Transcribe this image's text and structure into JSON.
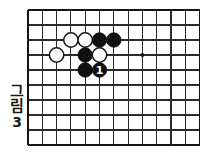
{
  "figure": {
    "caption_chars": [
      "그",
      "림"
    ],
    "caption_number": "3",
    "caption_full": "그림 3"
  },
  "board": {
    "columns": 13,
    "rows": 10,
    "origin_x": 28,
    "origin_y": 10,
    "spacing_x": 14.3,
    "spacing_y": 15,
    "line_color": "#2b2b2b",
    "edge_color": "#141414",
    "background_color": "#ffffff",
    "star_points": [
      {
        "col": 8,
        "row": 3,
        "label": "star-point"
      }
    ],
    "stones": [
      {
        "id": "w1",
        "color": "white",
        "col": 3,
        "row": 2,
        "label": ""
      },
      {
        "id": "w2",
        "color": "white",
        "col": 4,
        "row": 2,
        "label": ""
      },
      {
        "id": "b1",
        "color": "black",
        "col": 5,
        "row": 2,
        "label": ""
      },
      {
        "id": "b2",
        "color": "black",
        "col": 6,
        "row": 2,
        "label": ""
      },
      {
        "id": "w3",
        "color": "white",
        "col": 2,
        "row": 3,
        "label": ""
      },
      {
        "id": "b3",
        "color": "black",
        "col": 4,
        "row": 3,
        "label": ""
      },
      {
        "id": "w4",
        "color": "white",
        "col": 5,
        "row": 3,
        "label": ""
      },
      {
        "id": "b4",
        "color": "black",
        "col": 4,
        "row": 4,
        "label": ""
      },
      {
        "id": "b5",
        "color": "black",
        "col": 5,
        "row": 4,
        "label": "1"
      }
    ]
  },
  "colors": {
    "black_stone": "#111111",
    "white_stone": "#fdfdfd",
    "stone_outline": "#161616",
    "text": "#1a1a1a"
  }
}
